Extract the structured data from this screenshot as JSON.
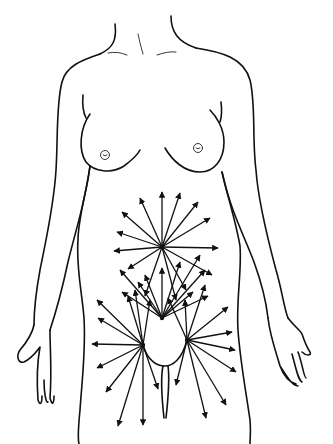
{
  "illustration": {
    "subject": "female-torso-pain-radiation-diagram",
    "colors": {
      "line": "#111111",
      "background": "#ffffff"
    },
    "radiation_centers": [
      {
        "name": "upper-abdomen-center",
        "x": 162,
        "y": 247,
        "rays": [
          [
            162,
            192
          ],
          [
            180,
            193
          ],
          [
            198,
            202
          ],
          [
            210,
            218
          ],
          [
            140,
            198
          ],
          [
            122,
            212
          ],
          [
            117,
            232
          ],
          [
            114,
            251
          ],
          [
            128,
            269
          ],
          [
            218,
            248
          ],
          [
            212,
            275
          ],
          [
            186,
            290
          ],
          [
            176,
            300
          ],
          [
            145,
            296
          ]
        ]
      },
      {
        "name": "lower-abdomen-center",
        "x": 162,
        "y": 318,
        "rays": [
          [
            120,
            270
          ],
          [
            145,
            275
          ],
          [
            162,
            268
          ],
          [
            180,
            262
          ],
          [
            200,
            255
          ],
          [
            205,
            270
          ],
          [
            122,
            292
          ],
          [
            138,
            282
          ],
          [
            193,
            292
          ],
          [
            208,
            296
          ]
        ]
      },
      {
        "name": "left-pelvic-center",
        "x": 143,
        "y": 345,
        "rays": [
          [
            97,
            300
          ],
          [
            98,
            318
          ],
          [
            92,
            344
          ],
          [
            97,
            368
          ],
          [
            106,
            392
          ],
          [
            118,
            426
          ],
          [
            143,
            425
          ],
          [
            158,
            389
          ],
          [
            128,
            296
          ],
          [
            135,
            290
          ],
          [
            150,
            300
          ]
        ]
      },
      {
        "name": "right-pelvic-center",
        "x": 187,
        "y": 340,
        "rays": [
          [
            228,
            307
          ],
          [
            232,
            332
          ],
          [
            235,
            350
          ],
          [
            236,
            372
          ],
          [
            226,
            405
          ],
          [
            206,
            418
          ],
          [
            176,
            385
          ],
          [
            185,
            300
          ],
          [
            168,
            298
          ],
          [
            205,
            285
          ]
        ]
      }
    ]
  }
}
